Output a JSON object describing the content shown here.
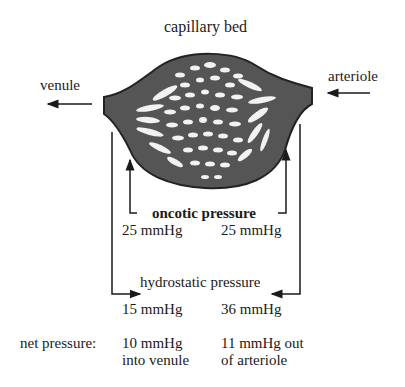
{
  "title": "capillary bed",
  "labels": {
    "venule": "venule",
    "arteriole": "arteriole",
    "oncotic": "oncotic pressure",
    "hydrostatic": "hydrostatic pressure",
    "net_label": "net pressure:"
  },
  "values": {
    "oncotic_venule": "25 mmHg",
    "oncotic_arteriole": "25 mmHg",
    "hydrostatic_venule": "15 mmHg",
    "hydrostatic_arteriole": "36 mmHg",
    "net_venule_line1": "10 mmHg",
    "net_venule_line2": "into venule",
    "net_arteriole_line1": "11 mmHg out",
    "net_arteriole_line2": "of arteriole"
  },
  "colors": {
    "bed_fill": "#555555",
    "bed_stroke": "#222222",
    "text": "#1a1a1a"
  }
}
